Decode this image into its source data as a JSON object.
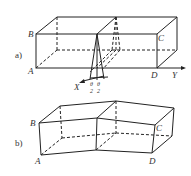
{
  "figure": {
    "panel_a": {
      "tag": "a)",
      "vertices": {
        "B": "B",
        "C": "C",
        "A": "A",
        "D": "D"
      },
      "axes": {
        "x": "X",
        "y": "Y"
      },
      "angle_labels": [
        {
          "num": "θ",
          "den": "2"
        },
        {
          "num": "θ",
          "den": "2"
        }
      ]
    },
    "panel_b": {
      "tag": "b)",
      "vertices": {
        "B": "B",
        "C": "C",
        "A": "A",
        "D": "D"
      }
    },
    "colors": {
      "line": "#222222",
      "background": "#ffffff"
    }
  }
}
